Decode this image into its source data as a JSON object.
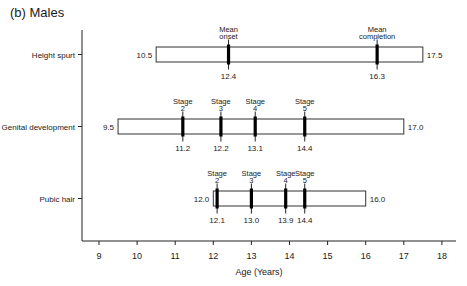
{
  "title": "(b) Males",
  "chart_data": {
    "type": "timeline-range",
    "title": "(b) Males",
    "xlabel": "Age (Years)",
    "ylabel": "",
    "xlim": [
      8.55,
      18.5
    ],
    "xticks": [
      9,
      10,
      11,
      12,
      13,
      14,
      15,
      16,
      17,
      18
    ],
    "grid": false,
    "rows": [
      {
        "label": "Height spurt",
        "start": 10.5,
        "end": 17.5,
        "markers": [
          {
            "label_lines": [
              "Mean",
              "onset"
            ],
            "value": 12.4
          },
          {
            "label_lines": [
              "Mean",
              "completion"
            ],
            "value": 16.3
          }
        ]
      },
      {
        "label": "Genital development",
        "start": 9.5,
        "end": 17.0,
        "markers": [
          {
            "label_lines": [
              "Stage",
              "2"
            ],
            "value": 11.2
          },
          {
            "label_lines": [
              "Stage",
              "3"
            ],
            "value": 12.2
          },
          {
            "label_lines": [
              "Stage",
              "4"
            ],
            "value": 13.1
          },
          {
            "label_lines": [
              "Stage",
              "5"
            ],
            "value": 14.4
          }
        ]
      },
      {
        "label": "Pubic hair",
        "start": 12.0,
        "end": 16.0,
        "markers": [
          {
            "label_lines": [
              "Stage",
              "2"
            ],
            "value": 12.1
          },
          {
            "label_lines": [
              "Stage",
              "3"
            ],
            "value": 13.0
          },
          {
            "label_lines": [
              "Stage",
              "4"
            ],
            "value": 13.9
          },
          {
            "label_lines": [
              "Stage",
              "5"
            ],
            "value": 14.4
          }
        ]
      }
    ]
  }
}
